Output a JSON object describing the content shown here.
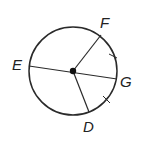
{
  "diagram": {
    "type": "circle-with-radii",
    "center": {
      "x": 73,
      "y": 71,
      "marked_with_dot": true
    },
    "radius": 44,
    "stroke_color": "#2a2a2a",
    "points": {
      "E": {
        "label": "E",
        "x": 29,
        "y": 66
      },
      "F": {
        "label": "F",
        "x": 101,
        "y": 35
      },
      "G": {
        "label": "G",
        "x": 117,
        "y": 79
      },
      "D": {
        "label": "D",
        "x": 89,
        "y": 112
      }
    },
    "segments": [
      {
        "from": "E",
        "to": "G",
        "kind": "diameter"
      },
      {
        "from": "center",
        "to": "F",
        "kind": "radius"
      },
      {
        "from": "center",
        "to": "D",
        "kind": "radius"
      }
    ],
    "congruence_ticks": [
      {
        "arc": "FG",
        "x": 113,
        "y": 56
      },
      {
        "arc": "GD",
        "x": 106,
        "y": 100
      }
    ]
  }
}
